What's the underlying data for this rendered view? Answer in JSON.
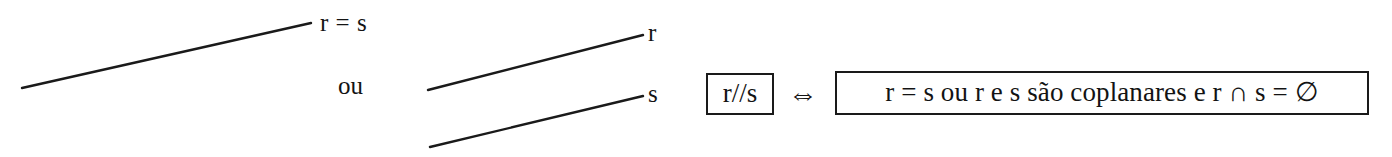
{
  "figure": {
    "width": 1392,
    "height": 157,
    "background_color": "#ffffff",
    "stroke_color": "#1a1a1a",
    "text_color": "#131313"
  },
  "diagram": {
    "case_coincident": {
      "line_label": "r = s",
      "line": {
        "x1": 22,
        "y1": 88,
        "x2": 311,
        "y2": 23
      }
    },
    "connector": {
      "label": "ou"
    },
    "case_parallel": {
      "line_r_label": "r",
      "line_s_label": "s",
      "line_r": {
        "x1": 428,
        "y1": 90,
        "x2": 643,
        "y2": 35
      },
      "line_s": {
        "x1": 430,
        "y1": 147,
        "x2": 643,
        "y2": 96
      }
    }
  },
  "formula": {
    "left_box_text": "r//s",
    "equivalence_symbol": "⇔",
    "right_box_text": "r = s ou r e s são coplanares e r ∩ s = ∅"
  }
}
